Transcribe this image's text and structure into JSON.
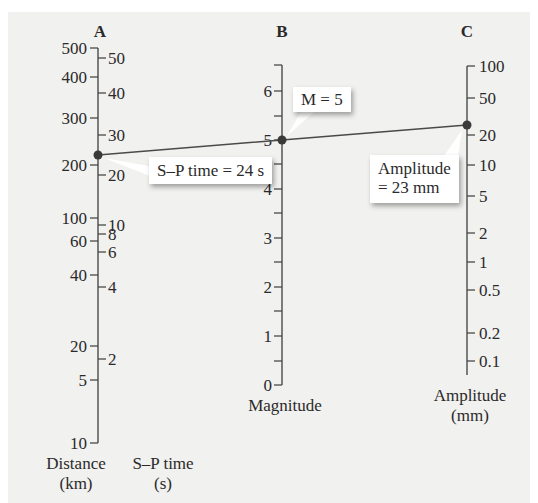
{
  "chart_data": {
    "type": "nomogram",
    "axes": [
      {
        "id": "A",
        "header": "A",
        "left_scale": {
          "name": "Distance",
          "unit": "km",
          "ticks": [
            {
              "label": "500",
              "y": 48
            },
            {
              "label": "400",
              "y": 77
            },
            {
              "label": "300",
              "y": 118
            },
            {
              "label": "200",
              "y": 165
            },
            {
              "label": "100",
              "y": 218
            },
            {
              "label": "60",
              "y": 241
            },
            {
              "label": "40",
              "y": 275
            },
            {
              "label": "20",
              "y": 346
            },
            {
              "label": "5",
              "y": 380
            },
            {
              "label": "10",
              "y": 443
            }
          ]
        },
        "right_scale": {
          "name": "S–P time",
          "unit": "s",
          "ticks": [
            {
              "label": "50",
              "y": 58
            },
            {
              "label": "40",
              "y": 93
            },
            {
              "label": "30",
              "y": 135
            },
            {
              "label": "20",
              "y": 175
            },
            {
              "label": "10",
              "y": 225
            },
            {
              "label": "8",
              "y": 234
            },
            {
              "label": "6",
              "y": 252
            },
            {
              "label": "4",
              "y": 287
            },
            {
              "label": "2",
              "y": 359
            }
          ]
        }
      },
      {
        "id": "B",
        "header": "B",
        "name": "Magnitude",
        "range": [
          0,
          6.5
        ],
        "labeled_ticks": [
          {
            "label": "6",
            "y": 91
          },
          {
            "label": "5",
            "y": 140
          },
          {
            "label": "4",
            "y": 189
          },
          {
            "label": "3",
            "y": 238
          },
          {
            "label": "2",
            "y": 287
          },
          {
            "label": "1",
            "y": 336
          },
          {
            "label": "0",
            "y": 385
          }
        ],
        "minor_ticks_y": [
          65,
          116,
          164,
          213,
          262,
          311,
          361
        ]
      },
      {
        "id": "C",
        "header": "C",
        "name": "Amplitude",
        "unit": "mm",
        "ticks": [
          {
            "label": "100",
            "y": 66
          },
          {
            "label": "50",
            "y": 98
          },
          {
            "label": "20",
            "y": 135
          },
          {
            "label": "10",
            "y": 165
          },
          {
            "label": "5",
            "y": 196
          },
          {
            "label": "2",
            "y": 233
          },
          {
            "label": "1",
            "y": 262
          },
          {
            "label": "0.5",
            "y": 290
          },
          {
            "label": "0.2",
            "y": 333
          },
          {
            "label": "0.1",
            "y": 361
          }
        ]
      }
    ],
    "reading_line": {
      "points": [
        {
          "axis": "A",
          "value": "S–P time = 24 s (≈215 km)",
          "x": 98,
          "y": 155
        },
        {
          "axis": "B",
          "value": "M = 5",
          "x": 282,
          "y": 140
        },
        {
          "axis": "C",
          "value": "Amplitude = 23 mm",
          "x": 467,
          "y": 125
        }
      ]
    },
    "annotations": [
      "S–P time = 24 s",
      "M = 5",
      "Amplitude = 23 mm"
    ]
  },
  "headers": {
    "a": "A",
    "b": "B",
    "c": "C"
  },
  "callouts": {
    "sp_time": "S–P time = 24 s",
    "magnitude": "M = 5",
    "amplitude_line1": "Amplitude",
    "amplitude_line2": "= 23 mm"
  },
  "axis_titles": {
    "distance_line1": "Distance",
    "distance_line2": "(km)",
    "sp_line1": "S–P time",
    "sp_line2": "(s)",
    "magnitude": "Magnitude",
    "amplitude_line1": "Amplitude",
    "amplitude_line2": "(mm)"
  },
  "colors": {
    "panel_bg": "#f1f1ef",
    "line": "#4a4a4a",
    "dot": "#3a3a3a",
    "callout_bg": "#ffffff"
  }
}
